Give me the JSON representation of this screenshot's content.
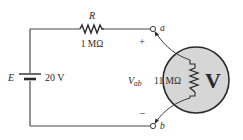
{
  "diagram": {
    "type": "circuit",
    "source": {
      "label": "E",
      "value": "20 V"
    },
    "resistor": {
      "label": "R",
      "value": "1 MΩ"
    },
    "terminals": {
      "a": "a",
      "b": "b",
      "plus": "+",
      "minus": "−"
    },
    "voltmeter": {
      "symbol": "V",
      "measured_label_main": "V",
      "measured_label_sub": "ab",
      "internal_resistance": "11 MΩ"
    },
    "colors": {
      "wire": "#4a4a4a",
      "meter_fill": "#d6d6d6",
      "text": "#2a2a2a"
    }
  }
}
